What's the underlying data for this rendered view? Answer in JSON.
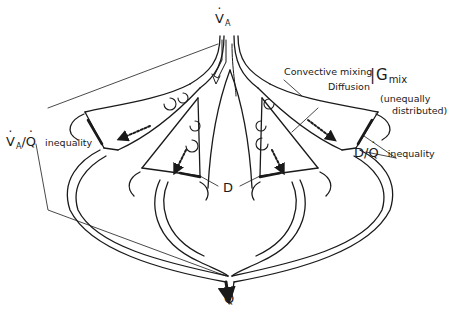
{
  "diagram": {
    "type": "schematic",
    "colors": {
      "ink": "#1a1a1a",
      "background": "#ffffff"
    },
    "labels": {
      "ventilation_symbol": "V",
      "ventilation_subscript": "A",
      "perfusion_symbol": "Q",
      "convective_mixing": "Convective mixing",
      "diffusion": "Diffusion",
      "gmix_symbol": "G",
      "gmix_subscript": "mix",
      "gmix_note_line1": "(unequally",
      "gmix_note_line2": "distributed)",
      "dq_symbol": "D/",
      "dq_q": "Q",
      "dq_text": "inequality",
      "vaq_v": "V",
      "vaq_sub": "A",
      "vaq_slash": "/",
      "vaq_q": "Q",
      "vaq_text": "inequality",
      "d_label": "D"
    },
    "nodes": [
      {
        "id": "airway-trunk",
        "label": "V̇A inflow"
      },
      {
        "id": "alveolus-left-upper"
      },
      {
        "id": "alveolus-left-lower"
      },
      {
        "id": "alveolus-center"
      },
      {
        "id": "alveolus-right-lower"
      },
      {
        "id": "alveolus-right-upper"
      },
      {
        "id": "capillary-network"
      },
      {
        "id": "venous-outflow",
        "label": "Q̇"
      }
    ]
  }
}
